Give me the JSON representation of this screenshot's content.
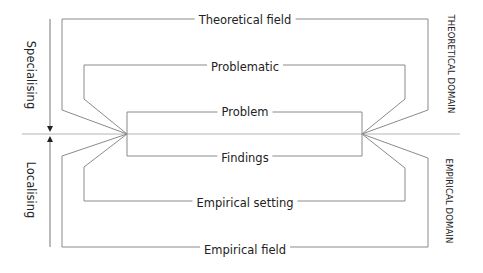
{
  "diagram": {
    "title": "",
    "center_labels": {
      "theoretical_field": "Theoretical field",
      "problematic": "Problematic",
      "problem": "Problem",
      "findings": "Findings",
      "empirical_setting": "Empirical setting",
      "empirical_field": "Empirical field"
    },
    "side_labels": {
      "specialising": "Specialising",
      "localising": "Localising"
    },
    "domain_labels": {
      "theoretical_domain": "THEORETICAL DOMAIN",
      "empirical_domain": "EMPIRICAL DOMAIN"
    },
    "colors": {
      "line": "#8a8a8a",
      "arrow": "#333333",
      "text": "#222222",
      "baseline": "#b5b5b5"
    }
  }
}
